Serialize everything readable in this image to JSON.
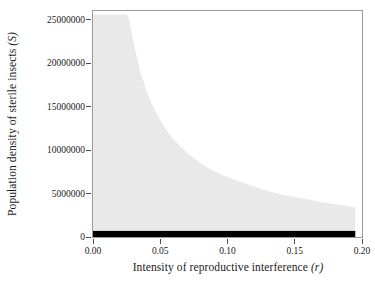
{
  "figure": {
    "name": "sterile-insect-release-region-plot"
  },
  "chart_data": {
    "type": "area",
    "title": "",
    "subtitle": "",
    "xlabel_text": "Intensity of reproductive interference",
    "xlabel_symbol": "(r)",
    "ylabel_text": "Population density of sterile insects",
    "ylabel_symbol": "(S)",
    "xlim": [
      0.0,
      0.2
    ],
    "ylim": [
      0,
      26000000
    ],
    "grid": false,
    "legend": null,
    "xticks": [
      0.0,
      0.05,
      0.1,
      0.15,
      0.2
    ],
    "xticklabels": [
      "0.00",
      "0.05",
      "0.10",
      "0.15",
      "0.20"
    ],
    "yticks": [
      0,
      5000000,
      10000000,
      15000000,
      20000000,
      25000000
    ],
    "yticklabels": [
      "0",
      "5000000",
      "10000000",
      "15000000",
      "20000000",
      "25000000"
    ],
    "regions": [
      {
        "name": "light-gray-eradication-region",
        "color": "#e9e9e9",
        "description": "Shaded region bounded above by 25000000 and on the right by a hyperbolically decaying threshold curve of sterile insect density versus reproductive interference intensity.",
        "boundary_x": [
          0.0,
          0.005,
          0.01,
          0.015,
          0.02,
          0.025,
          0.027,
          0.03,
          0.035,
          0.04,
          0.045,
          0.05,
          0.055,
          0.06,
          0.065,
          0.07,
          0.075,
          0.08,
          0.085,
          0.09,
          0.095,
          0.1,
          0.11,
          0.12,
          0.13,
          0.14,
          0.15,
          0.16,
          0.17,
          0.18,
          0.19,
          0.195
        ],
        "boundary_y": [
          25600000,
          25600000,
          25600000,
          25600000,
          25600000,
          25600000,
          25000000,
          22400000,
          19100000,
          16700000,
          14900000,
          13400000,
          12200000,
          11200000,
          10400000,
          9700000,
          9100000,
          8500000,
          8000000,
          7600000,
          7200000,
          6900000,
          6300000,
          5800000,
          5300000,
          4900000,
          4600000,
          4300000,
          4000000,
          3800000,
          3550000,
          3400000
        ]
      },
      {
        "name": "black-baseline-band",
        "color": "#000000",
        "description": "Solid black horizontal band just above zero spanning the full range of reproductive interference intensity.",
        "x_start": 0.0,
        "x_end": 0.195,
        "y_bottom": 0,
        "y_top": 700000
      }
    ]
  }
}
